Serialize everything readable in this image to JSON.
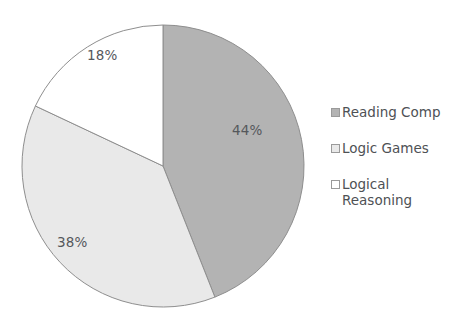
{
  "chart_data": {
    "type": "pie",
    "title": "",
    "categories": [
      "Reading Comp",
      "Logic Games",
      "Logical Reasoning"
    ],
    "values": [
      44,
      38,
      18
    ],
    "value_labels": [
      "44%",
      "38%",
      "18%"
    ],
    "colors": [
      "#b3b3b3",
      "#e9e9e9",
      "#ffffff"
    ],
    "slice_outline_color": "#8e8e8e",
    "start_angle_deg": 0,
    "direction": "clockwise",
    "legend_position": "right",
    "background": "#ffffff",
    "label_color": "#55585c",
    "slices": [
      {
        "label": "Reading Comp",
        "value": 44,
        "value_label": "44%",
        "color": "#b3b3b3",
        "label_x": 232,
        "label_y": 122
      },
      {
        "label": "Logic Games",
        "value": 38,
        "value_label": "38%",
        "color": "#e9e9e9",
        "label_x": 57,
        "label_y": 234
      },
      {
        "label": "Logical Reasoning",
        "value": 18,
        "value_label": "18%",
        "color": "#ffffff",
        "label_x": 87,
        "label_y": 47
      }
    ]
  },
  "legend": {
    "items": [
      {
        "label": "Reading Comp",
        "swatch": "#b3b3b3"
      },
      {
        "label": "Logic Games",
        "swatch": "#e9e9e9"
      },
      {
        "label": "Logical Reasoning",
        "swatch": "#ffffff"
      }
    ]
  }
}
